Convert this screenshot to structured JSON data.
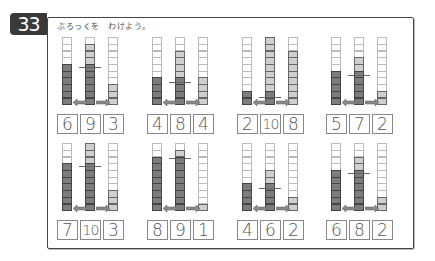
{
  "worksheet": {
    "number": "33",
    "instruction": "ぶろっくを　わけよう。",
    "colors": {
      "dark": "#7d7d7d",
      "light": "#cfcfcf",
      "empty": "#ffffff",
      "arrow": "#8a8a8a"
    },
    "rows": [
      {
        "problems": [
          {
            "left": "6",
            "total": "9",
            "right": "3"
          },
          {
            "left": "4",
            "total": "8",
            "right": "4"
          },
          {
            "left": "2",
            "total": "10",
            "right": "8"
          },
          {
            "left": "5",
            "total": "7",
            "right": "2"
          }
        ]
      },
      {
        "problems": [
          {
            "left": "7",
            "total": "10",
            "right": "3"
          },
          {
            "left": "8",
            "total": "9",
            "right": "1"
          },
          {
            "left": "4",
            "total": "6",
            "right": "2"
          },
          {
            "left": "6",
            "total": "8",
            "right": "2"
          }
        ]
      }
    ]
  }
}
